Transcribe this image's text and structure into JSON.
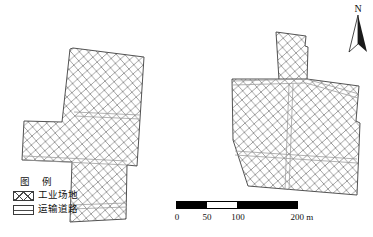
{
  "figure": {
    "type": "map",
    "background_color": "#ffffff",
    "outline_color": "#3a3a3a",
    "hatch_color": "#8c8c8c",
    "road_color": "#9a9a9a"
  },
  "legend": {
    "title": "图 例",
    "items": [
      {
        "label": "工业场地",
        "swatch": "crosshatch-swatch"
      },
      {
        "label": "运输道路",
        "swatch": "road-swatch"
      }
    ]
  },
  "scalebar": {
    "ticks": [
      "0",
      "50",
      "100",
      "200 m"
    ],
    "tick_values": [
      0,
      50,
      100,
      200
    ],
    "unit": "m",
    "segments": [
      {
        "from": 0,
        "to": 50,
        "fill": "#000000"
      },
      {
        "from": 50,
        "to": 100,
        "fill": "#ffffff"
      },
      {
        "from": 100,
        "to": 200,
        "fill": "#000000"
      }
    ]
  },
  "north_arrow": {
    "label": "N",
    "icon": "north-arrow-icon"
  },
  "map_features": {
    "left_site": {
      "name": "左侧工业场地",
      "outline": "73,48 144,57 137,166 127,165 126,219 70,222 72,162 22,160 24,121 62,122 70,49",
      "roads": [
        "74,113 140,116",
        "24,157 127,162",
        "71,207 127,205"
      ]
    },
    "right_site": {
      "name": "右侧工业场地",
      "outline": "276,32 306,36 305,46 308,47 307,81 359,86 356,121 360,122 357,195 248,186 233,140 232,80 279,80",
      "roads": [
        "233,82 307,80 359,96",
        "236,152 357,160",
        "291,84 286,190"
      ]
    }
  }
}
